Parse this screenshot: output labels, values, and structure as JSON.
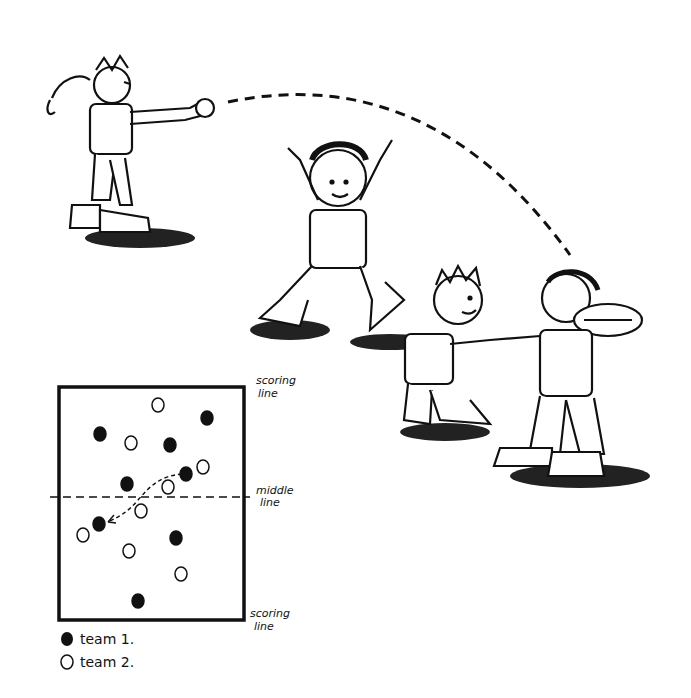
{
  "illustration": {
    "description": "Four cartoon children playing a ball game: one throws, one jumps with arms up, two hold hands while one catches a ball",
    "figures": [
      {
        "role": "thrower",
        "x": 120,
        "y": 160
      },
      {
        "role": "jumper",
        "x": 330,
        "y": 240
      },
      {
        "role": "small-child-holding-hands",
        "x": 450,
        "y": 360
      },
      {
        "role": "catcher-with-ball",
        "x": 570,
        "y": 390
      }
    ],
    "throw_path": "dashed arc from thrower's hand to catcher"
  },
  "diagram": {
    "labels": {
      "top": [
        "scoring",
        "line"
      ],
      "middle": [
        "middle",
        "line"
      ],
      "bottom": [
        "scoring",
        "line"
      ]
    },
    "team1_dots": [
      [
        207,
        418
      ],
      [
        100,
        434
      ],
      [
        170,
        445
      ],
      [
        186,
        474
      ],
      [
        127,
        484
      ],
      [
        99,
        524
      ],
      [
        176,
        538
      ],
      [
        138,
        601
      ]
    ],
    "team2_dots": [
      [
        158,
        405
      ],
      [
        131,
        443
      ],
      [
        203,
        467
      ],
      [
        168,
        487
      ],
      [
        141,
        511
      ],
      [
        83,
        535
      ],
      [
        129,
        551
      ],
      [
        181,
        574
      ]
    ],
    "pass_arrow": "dashed curve from team-1 player at middle to team-1 player below middle line"
  },
  "legend": {
    "team1": "team 1.",
    "team2": "team 2."
  },
  "colors": {
    "ink": "#111111",
    "paper": "#ffffff"
  }
}
